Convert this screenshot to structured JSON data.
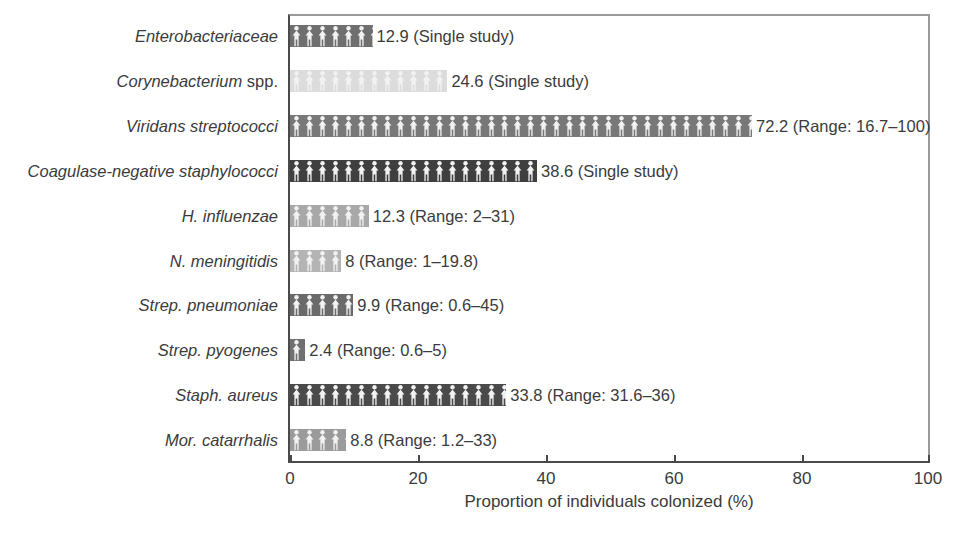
{
  "chart_data": {
    "type": "bar",
    "orientation": "horizontal",
    "title": "",
    "xlabel": "Proportion of individuals colonized (%)",
    "ylabel": "",
    "xlim": [
      0,
      100
    ],
    "xticks": [
      0,
      20,
      40,
      60,
      80,
      100
    ],
    "xticklabels": [
      "0",
      "20",
      "40",
      "60",
      "80",
      "100"
    ],
    "grid": false,
    "legend": false,
    "bar_fill_pattern": "person-icon-repeat",
    "categories": [
      "Enterobacteriaceae",
      "Corynebacterium spp.",
      "Viridans streptococci",
      "Coagulase-negative staphylococci",
      "H. influenzae",
      "N. meningitidis",
      "Strep. pneumoniae",
      "Strep. pyogenes",
      "Staph. aureus",
      "Mor. catarrhalis"
    ],
    "values": [
      12.9,
      24.6,
      72.2,
      38.6,
      12.3,
      8,
      9.9,
      2.4,
      33.8,
      8.8
    ],
    "annotations": [
      "12.9 (Single study)",
      "24.6 (Single study)",
      "72.2 (Range: 16.7–100)",
      "38.6 (Single study)",
      "12.3 (Range: 2–31)",
      "8 (Range: 1–19.8)",
      "9.9 (Range: 0.6–45)",
      "2.4 (Range: 0.6–5)",
      "33.8 (Range: 31.6–36)",
      "8.8 (Range: 1.2–33)"
    ],
    "bar_colors": [
      "#6f6f6f",
      "#dcdcdc",
      "#787878",
      "#3f3f3f",
      "#a8a8a8",
      "#b4b4b4",
      "#6a6a6a",
      "#707070",
      "#4a4a4a",
      "#9b9b9b"
    ]
  },
  "rows": [
    {
      "label_italic": "Enterobacteriaceae",
      "label_upright": "",
      "value": 12.9,
      "annotation": "12.9 (Single study)",
      "color": "#6f6f6f"
    },
    {
      "label_italic": "Corynebacterium",
      "label_upright": " spp.",
      "value": 24.6,
      "annotation": "24.6 (Single study)",
      "color": "#dcdcdc"
    },
    {
      "label_italic": "Viridans streptococci",
      "label_upright": "",
      "value": 72.2,
      "annotation": "72.2 (Range: 16.7–100)",
      "color": "#787878"
    },
    {
      "label_italic": "Coagulase-negative staphylococci",
      "label_upright": "",
      "value": 38.6,
      "annotation": "38.6 (Single study)",
      "color": "#3f3f3f"
    },
    {
      "label_italic": "H. influenzae",
      "label_upright": "",
      "value": 12.3,
      "annotation": "12.3 (Range: 2–31)",
      "color": "#a8a8a8"
    },
    {
      "label_italic": "N. meningitidis",
      "label_upright": "",
      "value": 8,
      "annotation": "8 (Range: 1–19.8)",
      "color": "#b4b4b4"
    },
    {
      "label_italic": "Strep. pneumoniae",
      "label_upright": "",
      "value": 9.9,
      "annotation": "9.9 (Range: 0.6–45)",
      "color": "#6a6a6a"
    },
    {
      "label_italic": "Strep. pyogenes",
      "label_upright": "",
      "value": 2.4,
      "annotation": "2.4 (Range: 0.6–5)",
      "color": "#707070"
    },
    {
      "label_italic": "Staph. aureus",
      "label_upright": "",
      "value": 33.8,
      "annotation": "33.8 (Range: 31.6–36)",
      "color": "#4a4a4a"
    },
    {
      "label_italic": "Mor. catarrhalis",
      "label_upright": "",
      "value": 8.8,
      "annotation": "8.8 (Range: 1.2–33)",
      "color": "#9b9b9b"
    }
  ],
  "axis": {
    "title": "Proportion of individuals colonized (%)",
    "ticks": [
      "0",
      "20",
      "40",
      "60",
      "80",
      "100"
    ]
  },
  "colors": {
    "text": "#3b3b3b",
    "frame": "#4a4a4a",
    "background": "#ffffff"
  }
}
